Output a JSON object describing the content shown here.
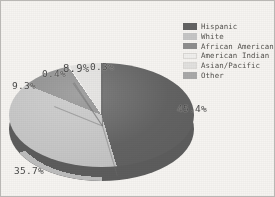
{
  "chart_data": {
    "type": "pie",
    "title": "",
    "subtitle": "",
    "xlabel": "",
    "ylabel": "",
    "grid": false,
    "legend_position": "top-right",
    "three_d": true,
    "unit": "%",
    "categories": [
      "Hispanic",
      "White",
      "African American",
      "American Indian",
      "Asian/Pacific",
      "Other"
    ],
    "values": [
      45.4,
      35.7,
      9.3,
      0.4,
      8.9,
      0.3
    ],
    "data_labels": [
      "45.4%",
      "35.7%",
      "9.3%",
      "0.4%",
      "8.9%",
      "0.3%"
    ],
    "colors": [
      "#636363",
      "#c6c6c6",
      "#8e8e8e",
      "#f0efed",
      "#e2e1df",
      "#a9a9a9"
    ],
    "slices": [
      {
        "label": "Hispanic",
        "value": 45.4,
        "data_label": "45.4%",
        "color": "#636363"
      },
      {
        "label": "White",
        "value": 35.7,
        "data_label": "35.7%",
        "color": "#c6c6c6"
      },
      {
        "label": "African American",
        "value": 9.3,
        "data_label": "9.3%",
        "color": "#8e8e8e"
      },
      {
        "label": "American Indian",
        "value": 0.4,
        "data_label": "0.4%",
        "color": "#f0efed"
      },
      {
        "label": "Asian/Pacific",
        "value": 8.9,
        "data_label": "8.9%",
        "color": "#e2e1df"
      },
      {
        "label": "Other",
        "value": 0.3,
        "data_label": "0.3%",
        "color": "#a9a9a9"
      }
    ]
  },
  "legend": {
    "items": [
      {
        "label": "Hispanic",
        "color": "#636363"
      },
      {
        "label": "White",
        "color": "#c6c6c6"
      },
      {
        "label": "African American",
        "color": "#8e8e8e"
      },
      {
        "label": "American Indian",
        "color": "#f0efed"
      },
      {
        "label": "Asian/Pacific",
        "color": "#e2e1df"
      },
      {
        "label": "Other",
        "color": "#a9a9a9"
      }
    ]
  },
  "figure": {
    "background": "#f6f4f1",
    "border_color": "#b9b7b4",
    "label_color": "#4a4a4a"
  }
}
